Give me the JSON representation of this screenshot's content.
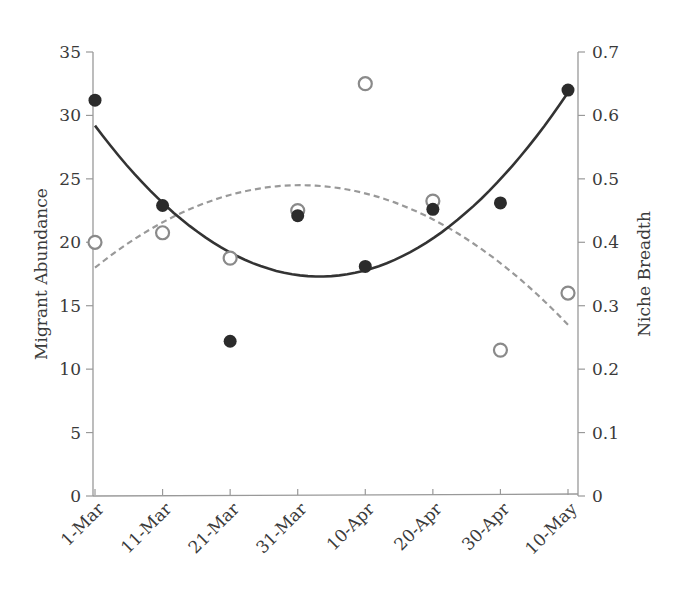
{
  "chart_data": {
    "type": "scatter",
    "title": "",
    "xlabel": "",
    "ylabel": "Migrant Abundance",
    "y2label": "Niche Breadth",
    "categories": [
      "1-Mar",
      "11-Mar",
      "21-Mar",
      "31-Mar",
      "10-Apr",
      "20-Apr",
      "30-Apr",
      "10-May"
    ],
    "ylim": [
      0,
      35
    ],
    "y_ticks": [
      0,
      5,
      10,
      15,
      20,
      25,
      30,
      35
    ],
    "y2lim": [
      0,
      0.7
    ],
    "y2_ticks": [
      "0",
      "0.1",
      "0.2",
      "0.3",
      "0.4",
      "0.5",
      "0.6",
      "0.7"
    ],
    "grid": false,
    "legend": "none",
    "series": [
      {
        "name": "Migrant Abundance",
        "axis": "left",
        "marker": "filled-circle",
        "color": "#2b2b2b",
        "values": [
          31.2,
          22.9,
          12.2,
          22.1,
          18.1,
          22.6,
          23.1,
          32.0
        ],
        "trendline": {
          "style": "solid",
          "type": "polynomial-2",
          "start": 29.2,
          "min": 17.3,
          "end": 31.8
        }
      },
      {
        "name": "Niche Breadth",
        "axis": "right",
        "marker": "open-circle",
        "color": "#8a8a8a",
        "values": [
          0.4,
          0.415,
          0.375,
          0.45,
          0.65,
          0.465,
          0.23,
          0.32
        ],
        "trendline": {
          "style": "dashed",
          "type": "polynomial-2",
          "start": 0.36,
          "max": 0.49,
          "end": 0.27
        }
      }
    ]
  }
}
